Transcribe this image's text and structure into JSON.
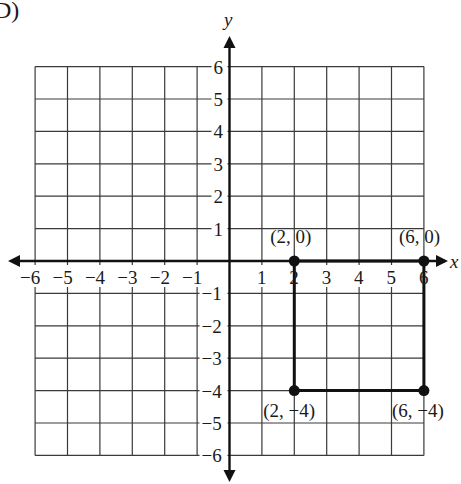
{
  "problem_label": "D)",
  "chart_data": {
    "type": "scatter",
    "title": "",
    "xlabel": "x",
    "ylabel": "y",
    "xlim": [
      -6,
      6
    ],
    "ylim": [
      -6,
      6
    ],
    "grid": true,
    "x_ticks": [
      -6,
      -5,
      -4,
      -3,
      -2,
      -1,
      1,
      2,
      3,
      4,
      5,
      6
    ],
    "y_ticks": [
      -6,
      -5,
      -4,
      -3,
      -2,
      -1,
      1,
      2,
      3,
      4,
      5,
      6
    ],
    "x_tick_labels": [
      "−6",
      "−5",
      "−4",
      "−3",
      "−2",
      "−1",
      "1",
      "2",
      "3",
      "4",
      "5",
      "6"
    ],
    "y_tick_labels": [
      "−6",
      "−5",
      "−4",
      "−3",
      "−2",
      "−1",
      "1",
      "2",
      "3",
      "4",
      "5",
      "6"
    ],
    "points": [
      {
        "x": 2,
        "y": 0,
        "label": "(2, 0)"
      },
      {
        "x": 6,
        "y": 0,
        "label": "(6, 0)"
      },
      {
        "x": 2,
        "y": -4,
        "label": "(2, −4)"
      },
      {
        "x": 6,
        "y": -4,
        "label": "(6, −4)"
      }
    ],
    "shape": {
      "type": "rectangle",
      "vertices": [
        [
          2,
          0
        ],
        [
          6,
          0
        ],
        [
          6,
          -4
        ],
        [
          2,
          -4
        ]
      ]
    },
    "legend": null
  }
}
